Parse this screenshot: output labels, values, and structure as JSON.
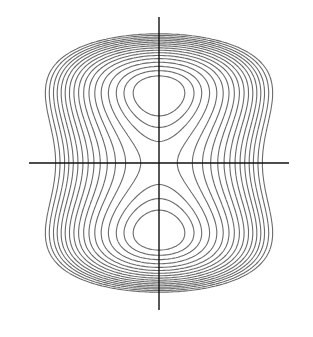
{
  "chart_data": {
    "type": "contour",
    "title": "",
    "xlabel": "",
    "ylabel": "",
    "grid": false,
    "legend": null,
    "origin_px": [
      159,
      163
    ],
    "axes": {
      "horizontal": {
        "x1": 29,
        "x2": 289,
        "y": 163
      },
      "vertical": {
        "x": 159,
        "y1": 17,
        "y2": 310
      }
    },
    "function": {
      "form": "f(u,v) = (v^2 - 1)^2 + c*u^2",
      "u_scale_px": 70,
      "v_scale_px": 70,
      "c": 2.2
    },
    "minima_px": [
      [
        159,
        95
      ],
      [
        159,
        236
      ]
    ],
    "saddle_px": [
      159,
      163
    ],
    "levels": [
      0.3,
      0.55,
      0.82,
      1.15,
      1.5,
      1.85,
      2.2,
      2.55,
      2.9,
      3.25,
      3.6,
      3.95,
      4.3,
      4.65,
      5.0,
      5.4,
      5.8
    ],
    "colors": {
      "contour": "#6b6b6b",
      "axis": "#111111",
      "background": "#ffffff"
    }
  }
}
